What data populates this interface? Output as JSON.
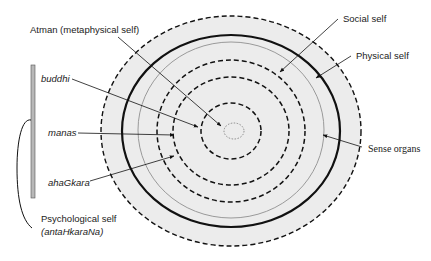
{
  "diagram": {
    "type": "concentric-self-model",
    "labels": {
      "atman": "Atman (metaphysical self)",
      "social_self": "Social self",
      "physical_self": "Physical self",
      "sense_organs": "Sense organs",
      "buddhi": "buddhi",
      "manas": "manas",
      "ahagkara": "ahaGkara",
      "psych_line1": "Psychological self",
      "psych_line2": "(antaHkaraNa)"
    },
    "colors": {
      "fill": "#ececec",
      "stroke": "#111111",
      "thin_ring": "#9a9a9a",
      "bar": "#b8b8b8"
    },
    "rings_outer_to_inner": [
      {
        "name": "outer-boundary",
        "style": "dashed"
      },
      {
        "name": "physical-self",
        "style": "thick-solid"
      },
      {
        "name": "sense-organs",
        "style": "thin-solid"
      },
      {
        "name": "social-self",
        "style": "dashed"
      },
      {
        "name": "ahagkara",
        "style": "dashed"
      },
      {
        "name": "buddhi-manas",
        "style": "dashed"
      },
      {
        "name": "atman",
        "style": "dotted"
      }
    ]
  }
}
